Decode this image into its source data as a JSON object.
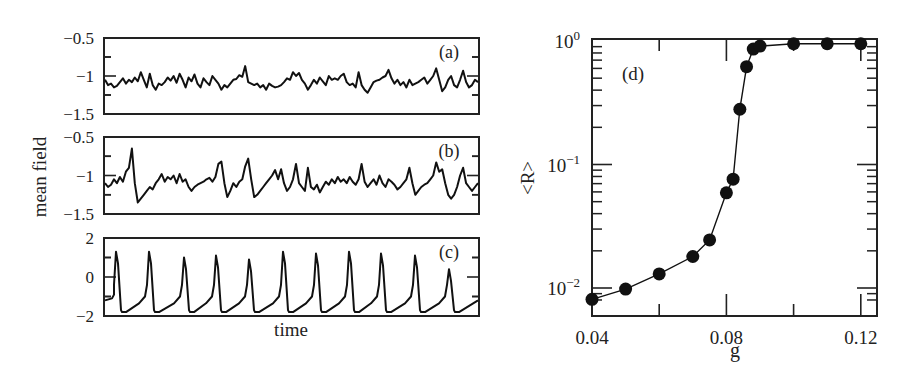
{
  "chart_data": [
    {
      "panel": "(a)",
      "type": "line",
      "title": "",
      "xlabel": "",
      "ylabel": "mean field",
      "ylim": [
        -1.5,
        -0.5
      ],
      "yticks": [
        -1.5,
        -1,
        -0.5
      ],
      "ytick_labels": [
        "−1.5",
        "−1",
        "−0.5"
      ],
      "description": "noisy fluctuations around -1.1 with small peaks up to about -0.85",
      "x": [
        0,
        1,
        2,
        3,
        4,
        5,
        6,
        7,
        8,
        9,
        10,
        11,
        12,
        13,
        14,
        15,
        16,
        17,
        18,
        19,
        20,
        21,
        22,
        23,
        24,
        25,
        26,
        27,
        28,
        29,
        30,
        31,
        32,
        33,
        34,
        35,
        36,
        37,
        38,
        39,
        40,
        41,
        42,
        43,
        44,
        45,
        46,
        47,
        48,
        49,
        50,
        51,
        52,
        53,
        54,
        55,
        56,
        57,
        58,
        59,
        60,
        61,
        62,
        63,
        64,
        65,
        66,
        67,
        68,
        69,
        70,
        71,
        72,
        73,
        74,
        75,
        76,
        77,
        78,
        79,
        80,
        81,
        82,
        83,
        84,
        85,
        86,
        87,
        88,
        89,
        90,
        91,
        92,
        93,
        94,
        95,
        96,
        97,
        98,
        99,
        100,
        101,
        102,
        103,
        104,
        105,
        106,
        107,
        108,
        109,
        110,
        111,
        112,
        113,
        114,
        115,
        116,
        117,
        118,
        119,
        120,
        121,
        122,
        123,
        124,
        125
      ],
      "values": [
        -1.05,
        -1.12,
        -1.1,
        -1.15,
        -1.13,
        -1.08,
        -1.03,
        -1.1,
        -1.05,
        -1.08,
        -1.02,
        -1.07,
        -0.95,
        -1.05,
        -1.15,
        -0.97,
        -1.12,
        -1.18,
        -1.1,
        -1.12,
        -1.08,
        -1.02,
        -1.06,
        -1.0,
        -1.09,
        -0.97,
        -1.05,
        -1.15,
        -1.02,
        -1.07,
        -0.98,
        -1.1,
        -1.15,
        -1.03,
        -1.08,
        -1.12,
        -1.0,
        -1.05,
        -1.1,
        -1.18,
        -1.12,
        -1.15,
        -1.1,
        -1.05,
        -1.04,
        -0.99,
        -1.01,
        -0.87,
        -1.08,
        -1.1,
        -1.12,
        -1.1,
        -1.15,
        -1.12,
        -1.18,
        -1.1,
        -1.13,
        -1.15,
        -1.14,
        -1.12,
        -1.08,
        -1.03,
        -1.05,
        -0.95,
        -1.0,
        -0.96,
        -1.05,
        -1.1,
        -1.18,
        -1.12,
        -1.05,
        -1.1,
        -1.02,
        -1.07,
        -1.12,
        -1.0,
        -1.05,
        -1.03,
        -1.05,
        -1.0,
        -0.97,
        -1.08,
        -1.12,
        -1.1,
        -1.15,
        -0.95,
        -1.12,
        -1.18,
        -1.22,
        -1.15,
        -1.08,
        -1.06,
        -1.05,
        -1.02,
        -1.0,
        -0.92,
        -1.03,
        -1.1,
        -1.05,
        -1.12,
        -1.08,
        -1.15,
        -1.05,
        -1.12,
        -1.1,
        -1.08,
        -1.05,
        -1.02,
        -1.1,
        -1.05,
        -1.0,
        -0.9,
        -1.05,
        -1.2,
        -1.15,
        -1.05,
        -1.0,
        -1.12,
        -1.15,
        -1.05,
        -0.93,
        -1.08,
        -1.15,
        -1.12,
        -1.05,
        -1.08
      ]
    },
    {
      "panel": "(b)",
      "type": "line",
      "ylim": [
        -1.5,
        -0.5
      ],
      "yticks": [
        -1.5,
        -1,
        -0.5
      ],
      "ytick_labels": [
        "−1.5",
        "−1",
        "−0.5"
      ],
      "description": "irregular spikes up to about -0.6 with dips to about -1.35",
      "x": [
        0,
        1,
        2,
        3,
        4,
        5,
        6,
        7,
        8,
        9,
        10,
        11,
        12,
        13,
        14,
        15,
        16,
        17,
        18,
        19,
        20,
        21,
        22,
        23,
        24,
        25,
        26,
        27,
        28,
        29,
        30,
        31,
        32,
        33,
        34,
        35,
        36,
        37,
        38,
        39,
        40,
        41,
        42,
        43,
        44,
        45,
        46,
        47,
        48,
        49,
        50,
        51,
        52,
        53,
        54,
        55,
        56,
        57,
        58,
        59,
        60,
        61,
        62,
        63,
        64,
        65,
        66,
        67,
        68,
        69,
        70,
        71,
        72,
        73,
        74,
        75,
        76,
        77,
        78,
        79,
        80,
        81,
        82,
        83,
        84,
        85,
        86,
        87,
        88,
        89,
        90,
        91,
        92,
        93,
        94,
        95,
        96,
        97,
        98,
        99,
        100,
        101,
        102,
        103,
        104,
        105,
        106,
        107,
        108,
        109,
        110,
        111,
        112,
        113,
        114,
        115,
        116,
        117,
        118,
        119,
        120,
        121,
        122,
        123,
        124,
        125
      ],
      "values": [
        -1.1,
        -1.15,
        -1.12,
        -1.05,
        -1.1,
        -1.02,
        -1.08,
        -0.95,
        -0.9,
        -0.65,
        -1.1,
        -1.35,
        -1.3,
        -1.25,
        -1.2,
        -1.15,
        -1.18,
        -1.1,
        -1.05,
        -0.98,
        -1.08,
        -1.02,
        -1.05,
        -1.0,
        -1.1,
        -0.98,
        -1.08,
        -1.05,
        -1.15,
        -1.2,
        -1.15,
        -1.12,
        -1.1,
        -1.08,
        -1.05,
        -1.03,
        -1.08,
        -1.02,
        -0.85,
        -0.82,
        -1.1,
        -1.28,
        -1.2,
        -1.1,
        -1.15,
        -1.08,
        -1.05,
        -0.88,
        -0.78,
        -1.05,
        -1.28,
        -1.25,
        -1.2,
        -1.15,
        -1.1,
        -1.05,
        -1.0,
        -0.93,
        -1.05,
        -0.92,
        -1.1,
        -1.2,
        -1.15,
        -1.05,
        -0.85,
        -1.1,
        -1.15,
        -1.2,
        -0.9,
        -1.15,
        -1.18,
        -1.12,
        -1.22,
        -1.15,
        -1.08,
        -1.12,
        -1.05,
        -1.1,
        -1.02,
        -1.08,
        -1.05,
        -1.1,
        -1.02,
        -1.08,
        -1.12,
        -1.05,
        -0.85,
        -1.08,
        -1.15,
        -1.1,
        -1.05,
        -1.12,
        -1.0,
        -1.1,
        -1.15,
        -1.05,
        -1.08,
        -1.12,
        -1.18,
        -1.15,
        -1.1,
        -1.05,
        -0.9,
        -1.1,
        -1.25,
        -1.2,
        -1.15,
        -1.12,
        -1.1,
        -1.05,
        -1.0,
        -0.83,
        -0.95,
        -0.92,
        -1.1,
        -1.25,
        -1.3,
        -1.25,
        -1.15,
        -1.0,
        -0.9,
        -1.1,
        -1.15,
        -1.2,
        -1.15,
        -1.1
      ]
    },
    {
      "panel": "(c)",
      "type": "line",
      "xlabel": "time",
      "ylim": [
        -2,
        2
      ],
      "yticks": [
        -2,
        0,
        2
      ],
      "ytick_labels": [
        "−2",
        "0",
        "2"
      ],
      "description": "regular periodic spikes (11 peaks), baseline about -1.8 rising to peaks about 1.3",
      "peak_positions_px": [
        116,
        149,
        184,
        216,
        249,
        283,
        316,
        349,
        381,
        415,
        449
      ],
      "peak_values": [
        1.3,
        1.3,
        1.0,
        1.1,
        0.9,
        1.3,
        1.2,
        1.3,
        1.2,
        1.1,
        0.4
      ],
      "baseline": -1.8
    },
    {
      "panel": "(d)",
      "type": "line",
      "marker": "filled circle",
      "xlabel": "g",
      "ylabel": "<R>",
      "xlim": [
        0.04,
        0.125
      ],
      "ylim": [
        0.0075,
        1.0
      ],
      "yscale": "log",
      "xticks": [
        0.04,
        0.08,
        0.12
      ],
      "xtick_labels": [
        "0.04",
        "0.08",
        "0.12"
      ],
      "yticks": [
        0.01,
        0.1,
        1
      ],
      "ytick_labels": [
        "10−2",
        "10−1",
        "10⁰"
      ],
      "x": [
        0.04,
        0.05,
        0.06,
        0.07,
        0.075,
        0.08,
        0.082,
        0.084,
        0.086,
        0.088,
        0.09,
        0.1,
        0.11,
        0.12
      ],
      "values": [
        0.0081,
        0.0098,
        0.013,
        0.018,
        0.0245,
        0.059,
        0.076,
        0.28,
        0.62,
        0.86,
        0.91,
        0.95,
        0.95,
        0.95
      ]
    }
  ],
  "labels": {
    "left_ylabel": "mean field",
    "left_xlabel": "time",
    "right_ylabel": "<R>",
    "right_xlabel": "g",
    "panel_a": "(a)",
    "panel_b": "(b)",
    "panel_c": "(c)",
    "panel_d": "(d)"
  }
}
